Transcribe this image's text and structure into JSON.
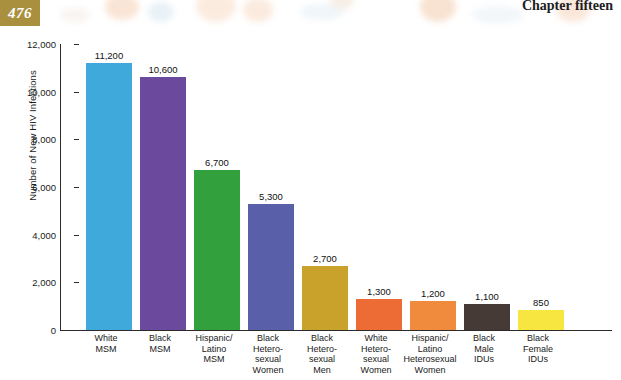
{
  "page": {
    "page_number": "476",
    "chapter_label": "Chapter fifteen"
  },
  "chart_data": {
    "type": "bar",
    "title": "",
    "xlabel": "",
    "ylabel": "Number of New HIV Infections",
    "ylim": [
      0,
      12000
    ],
    "ytick_labels": [
      "12,000",
      "10,000",
      "8,000",
      "6,000",
      "4,000",
      "2,000",
      "0"
    ],
    "ytick_values": [
      12000,
      10000,
      8000,
      6000,
      4000,
      2000,
      0
    ],
    "grid": false,
    "legend": "none",
    "categories": [
      "White MSM",
      "Black MSM",
      "Hispanic/ Latino MSM",
      "Black Heterosexual Women",
      "Black Heterosexual Men",
      "White Heterosexual Women",
      "Hispanic/ Latino Heterosexual Women",
      "Black Male IDUs",
      "Black Female IDUs"
    ],
    "category_lines": [
      [
        "White",
        "MSM"
      ],
      [
        "Black",
        "MSM"
      ],
      [
        "Hispanic/",
        "Latino",
        "MSM"
      ],
      [
        "Black",
        "Hetero-",
        "sexual",
        "Women"
      ],
      [
        "Black",
        "Hetero-",
        "sexual",
        "Men"
      ],
      [
        "White",
        "Hetero-",
        "sexual",
        "Women"
      ],
      [
        "Hispanic/",
        "Latino",
        "Heterosexual",
        "Women"
      ],
      [
        "Black",
        "Male",
        "IDUs"
      ],
      [
        "Black",
        "Female",
        "IDUs"
      ]
    ],
    "values": [
      11200,
      10600,
      6700,
      5300,
      2700,
      1300,
      1200,
      1100,
      850
    ],
    "value_labels": [
      "11,200",
      "10,600",
      "6,700",
      "5,300",
      "2,700",
      "1,300",
      "1,200",
      "1,100",
      "850"
    ],
    "colors": [
      "#3fa9dc",
      "#6b4a9e",
      "#32a03c",
      "#5a5faa",
      "#c9a22b",
      "#ed6b35",
      "#f08a3c",
      "#453a35",
      "#f7e63f"
    ]
  },
  "theme": {
    "page_number_box": "#a8903f",
    "axis": "#2b2b2b",
    "background": "#ffffff"
  }
}
